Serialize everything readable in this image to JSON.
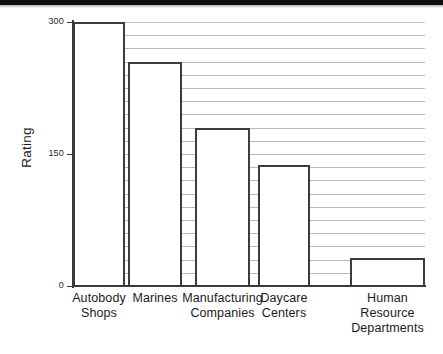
{
  "chart_data": {
    "type": "bar",
    "title": "",
    "xlabel": "",
    "ylabel": "Rating",
    "categories": [
      "Autobody Shops",
      "Marines",
      "Manufacturing Companies",
      "Daycare Centers",
      "Human Resource Departments"
    ],
    "category_lines": [
      [
        "Autobody",
        "Shops"
      ],
      [
        "Marines"
      ],
      [
        "Manufacturing",
        "Companies"
      ],
      [
        "Daycare",
        "Centers"
      ],
      [
        "Human",
        "Resource",
        "Departments"
      ]
    ],
    "values": [
      300,
      255,
      180,
      137,
      32
    ],
    "ylim": [
      0,
      300
    ],
    "yticks": [
      0,
      150,
      300
    ],
    "ytick_labels": [
      "0",
      "150",
      "300"
    ],
    "grid": true,
    "grid_interval": 15,
    "gridline_count": 19,
    "legend": "none",
    "bar_facecolor": "#ffffff",
    "bar_edgecolor": "#3c3c3c",
    "grid_color": "#b9b9b9",
    "axis_color": "#3a3a3a",
    "background": "#ffffff"
  }
}
